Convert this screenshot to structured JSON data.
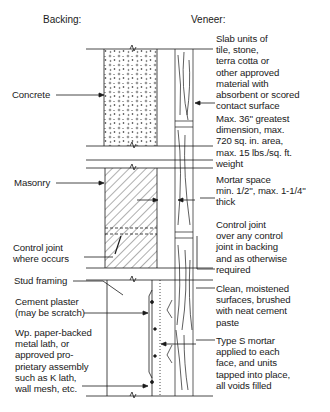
{
  "headers": {
    "backing": "Backing:",
    "veneer": "Veneer:"
  },
  "backing_labels": {
    "concrete": "Concrete",
    "masonry": "Masonry",
    "control_joint": "Control joint\nwhere occurs",
    "stud_framing": "Stud framing",
    "cement_plaster": "Cement plaster\n(may be scratch)",
    "lath": "Wp. paper-backed\nmetal lath, or\napproved pro-\nprietary assembly\nsuch as K lath,\nwall mesh, etc."
  },
  "veneer_labels": {
    "slab_units": "Slab units of\ntile, stone,\nterra cotta or\nother approved\nmaterial with\nabsorbent or scored\ncontact surface",
    "max_dimension": "Max. 36'' greatest\ndimension, max.\n720 sq. in. area,\nmax. 15 lbs./sq. ft.\nweight",
    "mortar_space": "Mortar space\nmin. 1/2'', max. 1-1/4''\nthick",
    "control_joint": "Control joint\nover any control\njoint in backing\nand as otherwise\nrequired",
    "clean_surfaces": "Clean, moistened\nsurfaces, brushed\nwith neat cement\npaste",
    "type_s_mortar": "Type S mortar\napplied to each\nface, and units\ntapped into place,\nall voids filled"
  },
  "colors": {
    "ink": "#1a1a1a",
    "background": "#ffffff"
  }
}
